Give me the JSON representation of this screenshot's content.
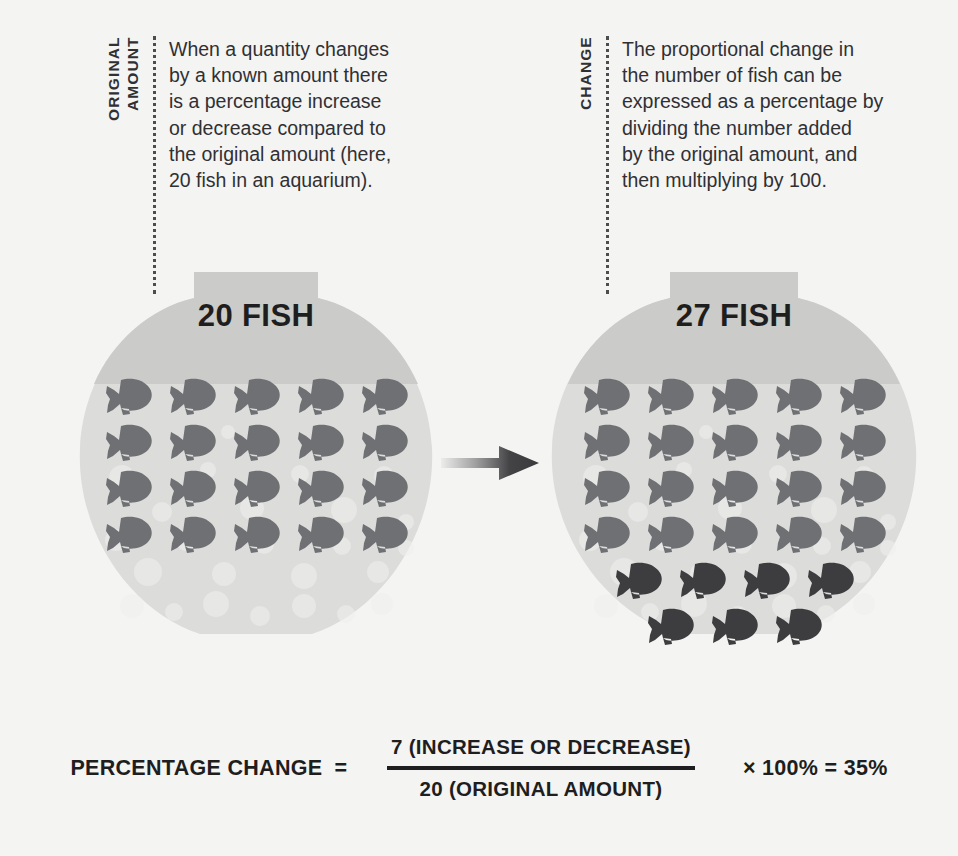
{
  "colors": {
    "background": "#f4f4f3",
    "bowl_glass": "#dcdcda",
    "bowl_neck": "#cbcbc9",
    "bowl_bubble": "#e8e8e6",
    "fish_original": "#6e7073",
    "fish_added": "#3d3d40",
    "text_dark": "#1e1e20",
    "dotted_line": "#4d4d50",
    "arrow": "#3a3a3d"
  },
  "annotations": {
    "left": {
      "vertical_label": "ORIGINAL\nAMOUNT",
      "body": "When a quantity changes\nby a known amount there\nis a percentage increase\nor decrease compared to\nthe original amount (here,\n20 fish in an aquarium)."
    },
    "right": {
      "vertical_label": "CHANGE",
      "body": "The proportional change in\nthe number of fish can be\nexpressed as a percentage by\ndividing the number added\nby the original amount, and\nthen multiplying by 100."
    }
  },
  "bowls": {
    "left": {
      "title": "20 FISH",
      "original_count": 20,
      "added_count": 0,
      "original_rows": [
        5,
        5,
        5,
        5
      ],
      "added_rows": []
    },
    "right": {
      "title": "27 FISH",
      "original_count": 20,
      "added_count": 7,
      "original_rows": [
        5,
        5,
        5,
        5
      ],
      "added_rows": [
        4,
        3
      ]
    }
  },
  "arrow": {
    "icon": "arrow-right-icon",
    "direction": "right"
  },
  "formula": {
    "lhs": "PERCENTAGE CHANGE",
    "equals": "=",
    "numerator": "7 (INCREASE OR DECREASE)",
    "denominator": "20 (ORIGINAL AMOUNT)",
    "rhs": "× 100% = 35%"
  },
  "chart_data": {
    "type": "bar",
    "categories": [
      "Original amount",
      "New amount"
    ],
    "values": [
      20,
      27
    ],
    "series": [
      {
        "name": "Original fish",
        "values": [
          20,
          20
        ]
      },
      {
        "name": "Added fish",
        "values": [
          0,
          7
        ]
      }
    ],
    "xlabel": "",
    "ylabel": "Number of fish",
    "ylim": [
      0,
      30
    ],
    "annotations": [
      "20 FISH",
      "27 FISH",
      "7 (INCREASE OR DECREASE) / 20 (ORIGINAL AMOUNT) × 100% = 35%"
    ],
    "legend": [
      "Original fish",
      "Added fish"
    ],
    "grid": false
  }
}
